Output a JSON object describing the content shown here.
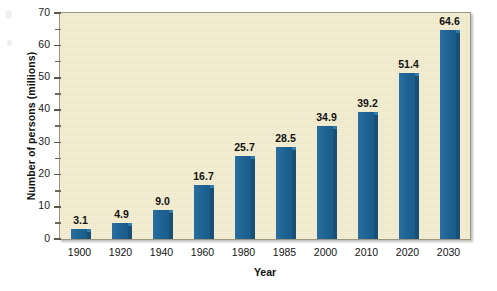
{
  "chart_data": {
    "type": "bar",
    "title": "",
    "subtitle": "",
    "xlabel": "Year",
    "ylabel": "Number of persons (millions)",
    "categories": [
      "1900",
      "1920",
      "1940",
      "1960",
      "1980",
      "1985",
      "2000",
      "2010",
      "2020",
      "2030"
    ],
    "values": [
      3.1,
      4.9,
      9.0,
      16.7,
      25.7,
      28.5,
      34.9,
      39.2,
      51.4,
      64.6
    ],
    "data_labels": [
      "3.1",
      "4.9",
      "9.0",
      "16.7",
      "25.7",
      "28.5",
      "34.9",
      "39.2",
      "51.4",
      "64.6"
    ],
    "ylim": [
      0,
      70
    ],
    "y_major_ticks": [
      0,
      10,
      20,
      30,
      40,
      50,
      60,
      70
    ],
    "y_minor_ticks": [
      5,
      15,
      25,
      35,
      45,
      55,
      65
    ],
    "y_tick_labels": [
      "0",
      "10",
      "20",
      "30",
      "40",
      "50",
      "60",
      "70"
    ],
    "grid": false,
    "legend": null,
    "legend_position": "none",
    "bar_color": "#1f6698",
    "bar_side_color": "#174f76",
    "bar_top_color": "#2f7cae",
    "plot_background": "#f1ebc9",
    "plot_border_color": "#9a9684",
    "text_color": "#121212"
  },
  "axes": {
    "y_title": "Number of persons (millions)",
    "x_title": "Year"
  }
}
